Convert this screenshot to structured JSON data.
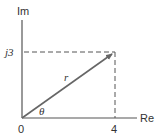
{
  "diagram": {
    "type": "complex-plane-phasor",
    "axes": {
      "vertical_label": "Im",
      "horizontal_label": "Re"
    },
    "ticks": {
      "origin": "0",
      "real_value": "4",
      "imag_value": "j3"
    },
    "vector": {
      "magnitude_label": "r",
      "angle_label": "θ",
      "from": [
        0,
        0
      ],
      "to": [
        4,
        3
      ]
    },
    "colors": {
      "axis": "#555555",
      "vector": "#666666",
      "dashed": "#555555",
      "text": "#333333"
    }
  }
}
